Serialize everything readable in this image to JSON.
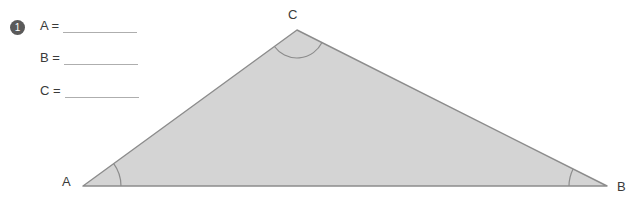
{
  "problem": {
    "number": "1",
    "number_icon": "filled-circle-number-badge"
  },
  "answers": [
    {
      "label": "A =",
      "value": "",
      "blank": true
    },
    {
      "label": "B =",
      "value": "",
      "blank": true
    },
    {
      "label": "C =",
      "value": "",
      "blank": true
    }
  ],
  "figure": {
    "type": "triangle",
    "fill_color": "#d4d4d4",
    "stroke_color": "#8c8c8c",
    "arc_color": "#8c8c8c",
    "vertices": [
      {
        "name": "A",
        "x": 83,
        "y": 186,
        "label": "A",
        "label_x": 62,
        "label_y": 174,
        "has_angle_arc": true
      },
      {
        "name": "B",
        "x": 607,
        "y": 186,
        "label": "B",
        "label_x": 617,
        "label_y": 179,
        "has_angle_arc": true
      },
      {
        "name": "C",
        "x": 297,
        "y": 30,
        "label": "C",
        "label_x": 288,
        "label_y": 7,
        "has_angle_arc": true
      }
    ]
  },
  "colors": {
    "background": "#ffffff",
    "text": "#3a3a3a",
    "rule_line": "#aeaeae",
    "badge": "#5a5a5a",
    "figure_fill": "#d4d4d4",
    "figure_stroke": "#8c8c8c"
  }
}
